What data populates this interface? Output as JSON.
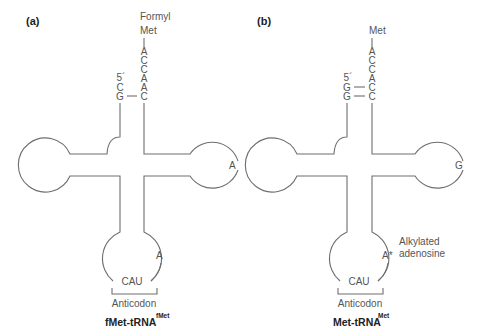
{
  "figure": {
    "colors": {
      "line": "#6e6e6e",
      "text": "#555555",
      "title": "#222222",
      "background": "#ffffff"
    }
  },
  "panels": [
    {
      "label": "(a)",
      "amino_acid_top": "Formyl",
      "amino_acid_bottom": "Met",
      "acceptor_3prime": [
        "A",
        "C",
        "C",
        "A",
        "A",
        "C"
      ],
      "five_prime_label": "5´",
      "acceptor_5prime": [
        "C",
        "G"
      ],
      "pairing": "G — C (single pair shown, top C unpaired)",
      "right_loop_base": "A",
      "anticodon_loop_base": "A",
      "anticodon": "CAU",
      "anticodon_label": "Anticodon",
      "name_main": "fMet-tRNA",
      "name_sup": "fMet"
    },
    {
      "label": "(b)",
      "amino_acid_bottom": "Met",
      "acceptor_3prime": [
        "A",
        "C",
        "C",
        "A",
        "C",
        "C"
      ],
      "five_prime_label": "5´",
      "acceptor_5prime": [
        "G",
        "G"
      ],
      "pairing": "G — C, G — C",
      "right_loop_base": "G",
      "anticodon_loop_base": "A*",
      "annotation_line1": "Alkylated",
      "annotation_line2": "adenosine",
      "anticodon": "CAU",
      "anticodon_label": "Anticodon",
      "name_main": "Met-tRNA",
      "name_sup": "Met"
    }
  ]
}
